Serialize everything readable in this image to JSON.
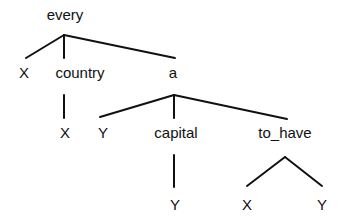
{
  "diagram": {
    "type": "tree",
    "root": {
      "label": "every",
      "children": [
        {
          "label": "X"
        },
        {
          "label": "country",
          "children": [
            {
              "label": "X"
            }
          ]
        },
        {
          "label": "a",
          "children": [
            {
              "label": "Y"
            },
            {
              "label": "capital",
              "children": [
                {
                  "label": "Y"
                }
              ]
            },
            {
              "label": "to_have",
              "children": [
                {
                  "label": "X"
                },
                {
                  "label": "Y"
                }
              ]
            }
          ]
        }
      ]
    },
    "nodes": {
      "every": "every",
      "every_x": "X",
      "country": "country",
      "country_x": "X",
      "a": "a",
      "a_y": "Y",
      "capital": "capital",
      "capital_y": "Y",
      "to_have": "to_have",
      "to_have_x": "X",
      "to_have_y": "Y"
    },
    "colors": {
      "line": "#111111",
      "text": "#111111",
      "background": "#ffffff"
    }
  }
}
